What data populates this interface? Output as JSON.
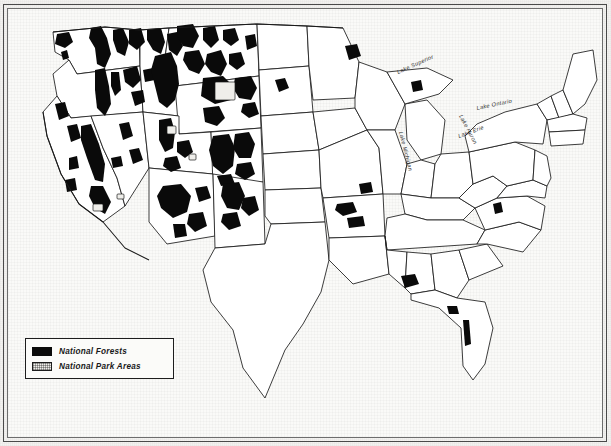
{
  "caption": {
    "text": "of Arizona and Oklahoma were still forested at this time"
  },
  "map": {
    "title": "National Forests and National Park Areas of the United States",
    "region": "Contiguous United States",
    "colors": {
      "national_forest_fill": "#0a0a0a",
      "national_park_fill": "#efeeea",
      "state_outline": "#1a1a1a",
      "paper": "#fafaf8",
      "frame": "#4a4a4a"
    },
    "water_labels": [
      {
        "name": "Lake Superior",
        "x": 395,
        "y": 66,
        "rotate": -24
      },
      {
        "name": "Lake Michigan",
        "x": 396,
        "y": 126,
        "rotate": 76
      },
      {
        "name": "Lake Huron",
        "x": 455,
        "y": 110,
        "rotate": 62
      },
      {
        "name": "Lake Ontario",
        "x": 478,
        "y": 104,
        "rotate": -12
      },
      {
        "name": "Lake Erie",
        "x": 462,
        "y": 130,
        "rotate": -20
      }
    ],
    "state_labels": [
      {
        "name": "Pennsylvania",
        "x": 505,
        "y": 146
      }
    ]
  },
  "legend": {
    "title": "Map key",
    "items": [
      {
        "label": "National Forests",
        "symbol": "solid-black-swatch"
      },
      {
        "label": "National Park Areas",
        "symbol": "stippled-light-swatch"
      }
    ]
  }
}
